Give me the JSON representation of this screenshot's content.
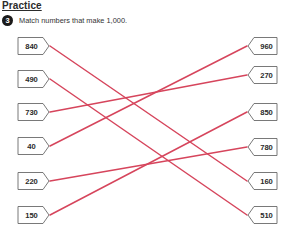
{
  "page": {
    "heading": "Practice",
    "question": {
      "number": "3",
      "text": "Match numbers that make 1,000."
    }
  },
  "colors": {
    "line": "#d6455c",
    "box_border": "#6a6a6a",
    "box_fill": "#ffffff"
  },
  "left_numbers": [
    {
      "value": "840",
      "y": 46
    },
    {
      "value": "490",
      "y": 79
    },
    {
      "value": "730",
      "y": 112
    },
    {
      "value": "40",
      "y": 146
    },
    {
      "value": "220",
      "y": 181
    },
    {
      "value": "150",
      "y": 215
    }
  ],
  "right_numbers": [
    {
      "value": "960",
      "y": 46
    },
    {
      "value": "270",
      "y": 75
    },
    {
      "value": "850",
      "y": 112
    },
    {
      "value": "780",
      "y": 147
    },
    {
      "value": "160",
      "y": 181
    },
    {
      "value": "510",
      "y": 215
    }
  ],
  "matches": [
    {
      "left": "840",
      "right": "160"
    },
    {
      "left": "490",
      "right": "510"
    },
    {
      "left": "730",
      "right": "270"
    },
    {
      "left": "40",
      "right": "960"
    },
    {
      "left": "220",
      "right": "780"
    },
    {
      "left": "150",
      "right": "850"
    }
  ]
}
